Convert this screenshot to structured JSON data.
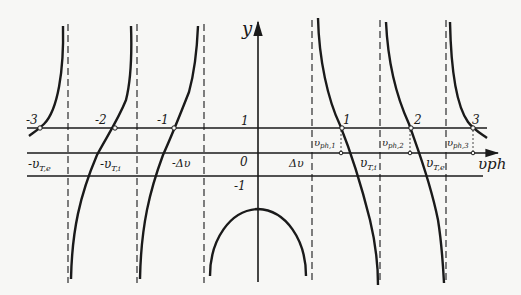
{
  "diagram": {
    "axis_y_label": "y",
    "axis_x_label": "υph",
    "line_labels": {
      "one": "1",
      "zero": "0",
      "minus_one": "-1"
    },
    "intersection_labels": [
      "-3",
      "-2",
      "-1",
      "1",
      "2",
      "3"
    ],
    "asymptote_labels": {
      "neg_vTe": "-υ",
      "neg_vTe_sub": "T,e",
      "neg_vTi": "-υ",
      "neg_vTi_sub": "T,i",
      "neg_dv": "-Δυ",
      "dv": "Δυ",
      "vTi": "υ",
      "vTi_sub": "T,i",
      "vTe": "υ",
      "vTe_sub": "T,e"
    },
    "phase_velocity_labels": [
      {
        "main": "υ",
        "sub": "ph,1"
      },
      {
        "main": "υ",
        "sub": "ph,2"
      },
      {
        "main": "υ",
        "sub": "ph,3"
      }
    ],
    "colors": {
      "ink": "#1a1a1a",
      "paper": "#f7f7f5"
    }
  }
}
